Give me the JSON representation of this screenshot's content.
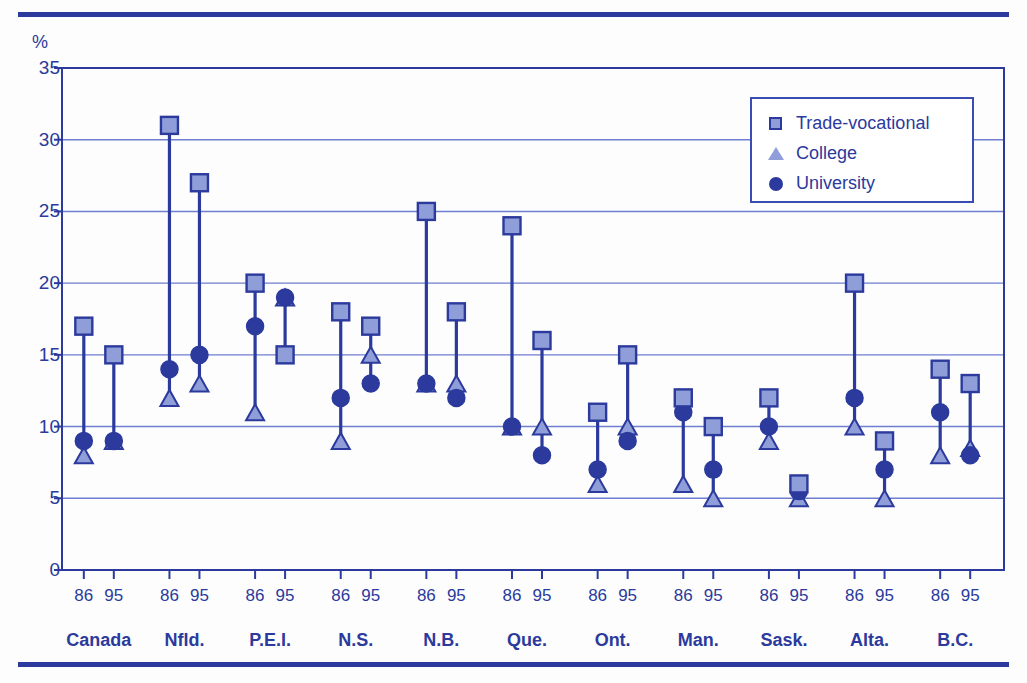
{
  "chart_data": {
    "type": "scatter",
    "title": "",
    "subtitle": "",
    "xlabel": "",
    "ylabel": "%",
    "ylim": [
      0,
      35
    ],
    "yticks": [
      0,
      5,
      10,
      15,
      20,
      25,
      30,
      35
    ],
    "grid": true,
    "legend_position": "top-right",
    "legend": [
      "Trade-vocational",
      "College",
      "University"
    ],
    "series": [
      {
        "name": "Trade-vocational",
        "marker": "square",
        "fill": "#8f9ed8",
        "stroke": "#2b3a9c",
        "values": [
          17,
          15,
          31,
          27,
          20,
          15,
          18,
          17,
          25,
          18,
          24,
          16,
          11,
          15,
          12,
          10,
          12,
          6,
          20,
          9,
          14,
          13
        ]
      },
      {
        "name": "College",
        "marker": "triangle",
        "fill": "#8f9ed8",
        "stroke": "#2b3a9c",
        "values": [
          8,
          9,
          12,
          13,
          11,
          19,
          9,
          15,
          13,
          13,
          10,
          10,
          6,
          10,
          6,
          5,
          9,
          5,
          10,
          5,
          8,
          8.5
        ]
      },
      {
        "name": "University",
        "marker": "circle",
        "fill": "#2b3a9c",
        "stroke": "#2b3a9c",
        "values": [
          9,
          9,
          14,
          15,
          17,
          19,
          12,
          13,
          13,
          12,
          10,
          8,
          7,
          9,
          11,
          7,
          10,
          5.5,
          12,
          7,
          11,
          8
        ]
      }
    ],
    "x_categories": [
      "86",
      "95",
      "86",
      "95",
      "86",
      "95",
      "86",
      "95",
      "86",
      "95",
      "86",
      "95",
      "86",
      "95",
      "86",
      "95",
      "86",
      "95",
      "86",
      "95",
      "86",
      "95"
    ],
    "groups": [
      {
        "label": "Canada",
        "years": [
          "86",
          "95"
        ]
      },
      {
        "label": "Nfld.",
        "years": [
          "86",
          "95"
        ]
      },
      {
        "label": "P.E.I.",
        "years": [
          "86",
          "95"
        ]
      },
      {
        "label": "N.S.",
        "years": [
          "86",
          "95"
        ]
      },
      {
        "label": "N.B.",
        "years": [
          "86",
          "95"
        ]
      },
      {
        "label": "Que.",
        "years": [
          "86",
          "95"
        ]
      },
      {
        "label": "Ont.",
        "years": [
          "86",
          "95"
        ]
      },
      {
        "label": "Man.",
        "years": [
          "86",
          "95"
        ]
      },
      {
        "label": "Sask.",
        "years": [
          "86",
          "95"
        ]
      },
      {
        "label": "Alta.",
        "years": [
          "86",
          "95"
        ]
      },
      {
        "label": "B.C.",
        "years": [
          "86",
          "95"
        ]
      }
    ]
  },
  "colors": {
    "accent": "#2b3a9c",
    "marker_light": "#8f9ed8",
    "gridline": "#6f7fd0",
    "axis": "#2b3a9c",
    "background": "#fdfdfd"
  },
  "axis": {
    "unit_label": "%"
  }
}
